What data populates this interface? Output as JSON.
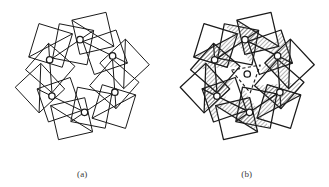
{
  "figure": {
    "background_color": "#ffffff",
    "stroke_color": "#1a1a1a",
    "hatch_color": "#4a4a4a",
    "dashed_color": "#1a1a1a",
    "panels": [
      {
        "id": "a",
        "caption": "(a)",
        "style": "outline",
        "description": "Six-fold ring of squares, each bisected by a diagonal, enclosing a central hexagonal void; a small open circle marks each square centre.",
        "square_count": 12,
        "circle_count": 6,
        "has_hatching": false,
        "has_dashed_triangle": false
      },
      {
        "id": "b",
        "caption": "(b)",
        "style": "hatched",
        "description": "Same six-fold ring of squares with one triangular half of each square filled with diagonal hatching; a dashed triangle with an open circle occupies the centre.",
        "square_count": 12,
        "circle_count": 7,
        "has_hatching": true,
        "has_dashed_triangle": true
      }
    ]
  },
  "geometry": {
    "panel_a": {
      "center": [
        83,
        78
      ],
      "ring_radius": 34,
      "square_half": 19,
      "rotation_deg": 14,
      "symmetry_fold": 6,
      "circle_radius": 3.4
    },
    "panel_b": {
      "center": [
        247,
        78
      ],
      "ring_radius": 34,
      "square_half": 19,
      "rotation_deg": 14,
      "symmetry_fold": 6,
      "circle_radius": 3.4,
      "dashed_triangle_side": 30
    }
  },
  "chart_data": {
    "type": "diagram",
    "title": "",
    "panels": [
      "(a)",
      "(b)"
    ],
    "motif": "square-and-triangle tiling with six-fold rotational symmetry",
    "markers": "open circles at square centres"
  }
}
